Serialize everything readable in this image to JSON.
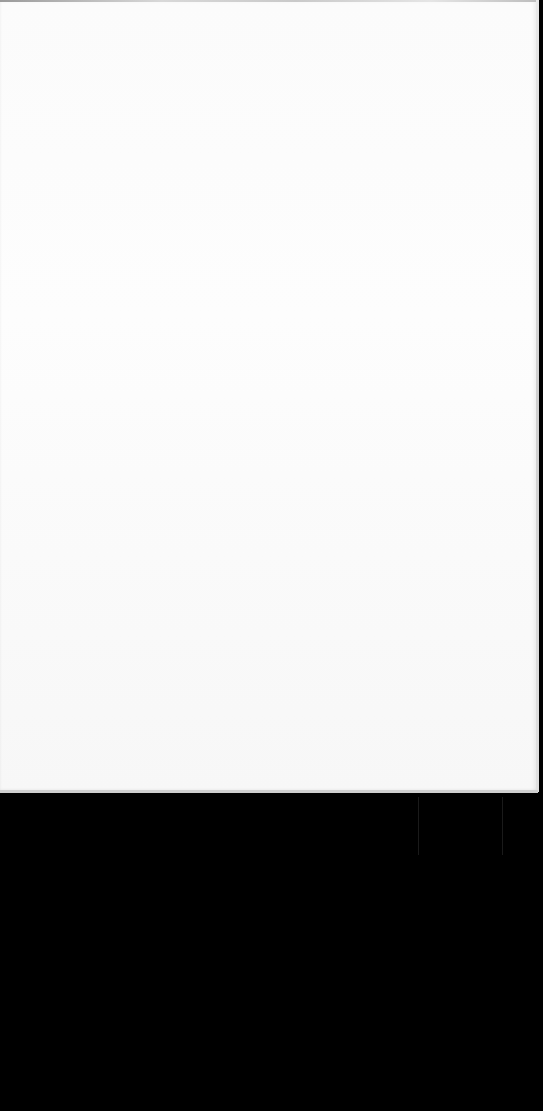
{
  "scene": {
    "description": "Blank white sheet of paper photographed against a black background",
    "paper": {
      "content_text": "",
      "color": "#fbfbfb"
    },
    "background": {
      "color": "#000000"
    }
  }
}
